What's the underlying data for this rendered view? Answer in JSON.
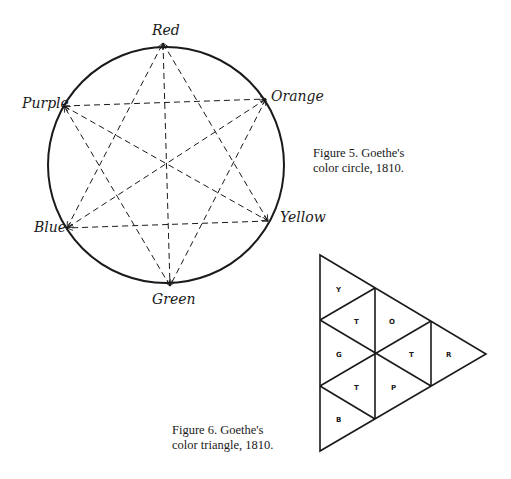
{
  "figure5": {
    "caption_line1": "Figure 5. Goethe's",
    "caption_line2": "color circle, 1810.",
    "labels": {
      "red": "Red",
      "orange": "Orange",
      "yellow": "Yellow",
      "green": "Green",
      "blue": "Blue",
      "purple": "Purple"
    },
    "line_color": "#1a1a1a"
  },
  "figure6": {
    "caption_line1": "Figure 6. Goethe's",
    "caption_line2": "color triangle, 1810.",
    "cells": {
      "y": "Y",
      "t1": "T",
      "o": "O",
      "g": "G",
      "t2": "T",
      "r": "R",
      "t3": "T",
      "p": "P",
      "b": "B"
    },
    "line_color": "#1a1a1a"
  }
}
